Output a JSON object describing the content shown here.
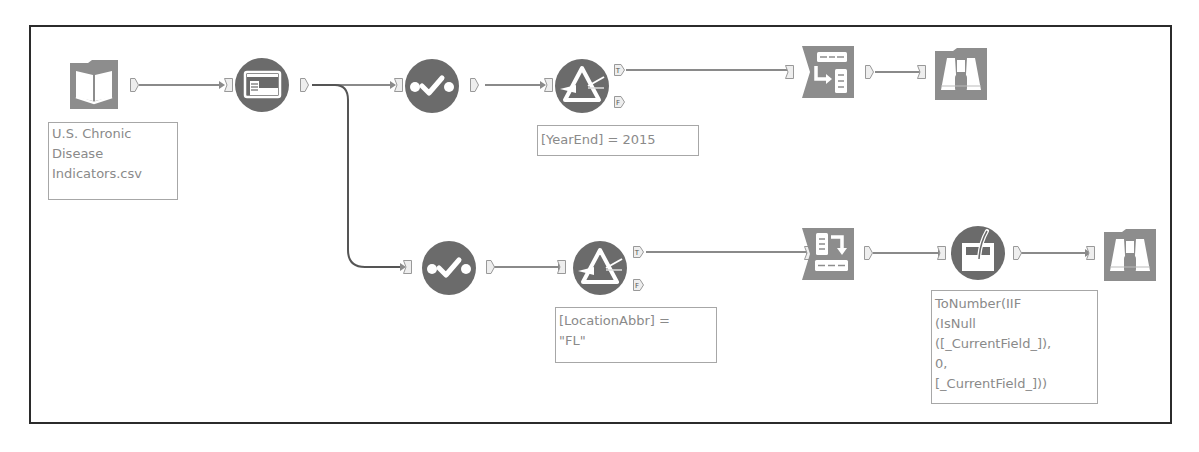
{
  "workflow": {
    "colors": {
      "tool_fill": "#6b6b6b",
      "frame": "#2b2b2b",
      "wire": "#8a8a8a",
      "annotation_text": "#8a8a8a",
      "annotation_border": "#a7a7a7"
    },
    "tools": [
      {
        "id": "input",
        "type": "Input Data",
        "icon": "book-icon"
      },
      {
        "id": "select",
        "type": "Select",
        "icon": "select-icon"
      },
      {
        "id": "sample-top",
        "type": "Sample/Check",
        "icon": "check-dots-icon"
      },
      {
        "id": "filter-top",
        "type": "Filter",
        "icon": "prism-filter-icon"
      },
      {
        "id": "crosstab",
        "type": "Cross Tab",
        "icon": "crosstab-icon"
      },
      {
        "id": "browse-top",
        "type": "Browse",
        "icon": "binoculars-icon"
      },
      {
        "id": "sample-bottom",
        "type": "Sample/Check",
        "icon": "check-dots-icon"
      },
      {
        "id": "filter-bottom",
        "type": "Filter",
        "icon": "prism-filter-icon"
      },
      {
        "id": "transpose",
        "type": "Transpose",
        "icon": "transpose-icon"
      },
      {
        "id": "multifield",
        "type": "Multi-Field Formula",
        "icon": "beaker-formula-icon"
      },
      {
        "id": "browse-bottom",
        "type": "Browse",
        "icon": "binoculars-icon"
      }
    ],
    "annotations": {
      "input": "U.S. Chronic\nDisease\nIndicators.csv",
      "filter_top": "[YearEnd] = 2015",
      "filter_bottom": "[LocationAbbr] =\n\"FL\"",
      "multifield": "ToNumber(IIF\n(IsNull\n([_CurrentField_]),\n0,\n[_CurrentField_]))"
    },
    "anchors": {
      "true_label": "T",
      "false_label": "F"
    }
  }
}
